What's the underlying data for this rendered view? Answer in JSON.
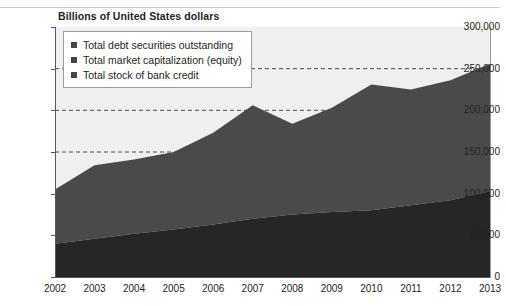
{
  "chart_title": "Billions of United States dollars",
  "legend": {
    "items": [
      {
        "label": "Total debt securities outstanding",
        "color": "#454545"
      },
      {
        "label": "Total market capitalization (equity)",
        "color": "#454545"
      },
      {
        "label": "Total stock of bank credit",
        "color": "#454545"
      }
    ]
  },
  "axes": {
    "y_ticks": [
      "0",
      "50,000",
      "100,000",
      "150,000",
      "200,000",
      "250,000",
      "300,000"
    ],
    "x_ticks": [
      "2002",
      "2003",
      "2004",
      "2005",
      "2006",
      "2007",
      "2008",
      "2009",
      "2010",
      "2011",
      "2012",
      "2013"
    ]
  },
  "colors": {
    "plot_background": "#efefed",
    "band_debt_securities": "#e6e6e3",
    "band_market_cap": "#4a4a4a",
    "band_bank_credit": "#262626",
    "axis": "#58595b",
    "gridline": "#4a4a4a"
  },
  "chart_data": {
    "type": "area",
    "title": "Billions of United States dollars",
    "xlabel": "",
    "ylabel": "Billions of United States dollars",
    "stacked": true,
    "grid": true,
    "gridlines_y": [
      150000,
      200000,
      250000
    ],
    "legend_position": "top-left",
    "ylim": [
      0,
      300000
    ],
    "categories": [
      "2002",
      "2003",
      "2004",
      "2005",
      "2006",
      "2007",
      "2008",
      "2009",
      "2010",
      "2011",
      "2012",
      "2013"
    ],
    "series": [
      {
        "name": "Total stock of bank credit",
        "color": "#262626",
        "values": [
          40000,
          46000,
          52000,
          57000,
          63000,
          70000,
          75000,
          78000,
          80000,
          86000,
          92000,
          103000
        ]
      },
      {
        "name": "Total market capitalization (equity)",
        "color": "#4a4a4a",
        "values": [
          65000,
          88000,
          89000,
          93000,
          110000,
          136000,
          109000,
          125000,
          151000,
          139000,
          144000,
          153000
        ]
      },
      {
        "name": "Total debt securities outstanding",
        "color": "#e6e6e3",
        "values": [
          0,
          0,
          0,
          0,
          0,
          0,
          0,
          0,
          0,
          0,
          0,
          0
        ]
      }
    ],
    "cumulative_totals": [
      105000,
      134000,
      141000,
      150000,
      173000,
      206000,
      184000,
      203000,
      231000,
      225000,
      236000,
      256000
    ]
  }
}
